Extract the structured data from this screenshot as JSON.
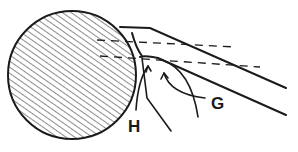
{
  "diagram": {
    "type": "technical-line-drawing",
    "colors": {
      "ink": "#1a1a1a",
      "background": "#ffffff"
    },
    "labels": {
      "h": "H",
      "g": "G"
    },
    "elements": [
      "hatched-circular-workpiece",
      "cutting-tool-body",
      "dashed-reference-lines",
      "chip-curl-H",
      "chip-curl-G"
    ]
  }
}
